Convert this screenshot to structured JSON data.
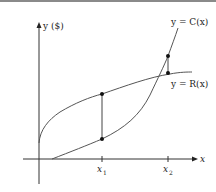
{
  "diagram": {
    "y_axis_label": "y ($)",
    "x_axis_label": "x",
    "curve_cost_label": "y = C(x)",
    "curve_revenue_label": "y = R(x)",
    "tick_labels": [
      {
        "main": "x",
        "sub": "1"
      },
      {
        "main": "x",
        "sub": "2"
      }
    ],
    "colors": {
      "axis": "#333333",
      "curve": "#555555",
      "point": "#111111",
      "border_top": "#8a8a8a"
    }
  }
}
